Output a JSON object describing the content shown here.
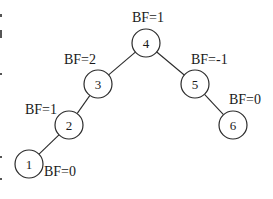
{
  "diagram": {
    "type": "binary-tree",
    "nodes": [
      {
        "id": "4",
        "label": "4",
        "cx": 146,
        "cy": 43,
        "bf": "BF=1",
        "bf_x": 132,
        "bf_y": 22
      },
      {
        "id": "3",
        "label": "3",
        "cx": 98,
        "cy": 84,
        "bf": "BF=2",
        "bf_x": 64,
        "bf_y": 64
      },
      {
        "id": "5",
        "label": "5",
        "cx": 195,
        "cy": 84,
        "bf": "BF=-1",
        "bf_x": 191,
        "bf_y": 64
      },
      {
        "id": "2",
        "label": "2",
        "cx": 69,
        "cy": 125,
        "bf": "BF=1",
        "bf_x": 25,
        "bf_y": 114
      },
      {
        "id": "6",
        "label": "6",
        "cx": 233,
        "cy": 125,
        "bf": "BF=0",
        "bf_x": 229,
        "bf_y": 104
      },
      {
        "id": "1",
        "label": "1",
        "cx": 29,
        "cy": 164,
        "bf": "BF=0",
        "bf_x": 44,
        "bf_y": 176
      }
    ],
    "edges": [
      {
        "from": "4",
        "to": "3"
      },
      {
        "from": "4",
        "to": "5"
      },
      {
        "from": "3",
        "to": "2"
      },
      {
        "from": "2",
        "to": "1"
      },
      {
        "from": "5",
        "to": "6"
      }
    ],
    "node_radius": 14,
    "colors": {
      "stroke": "#2a2a2a",
      "text": "#1a1a1a",
      "background": "#ffffff"
    }
  }
}
